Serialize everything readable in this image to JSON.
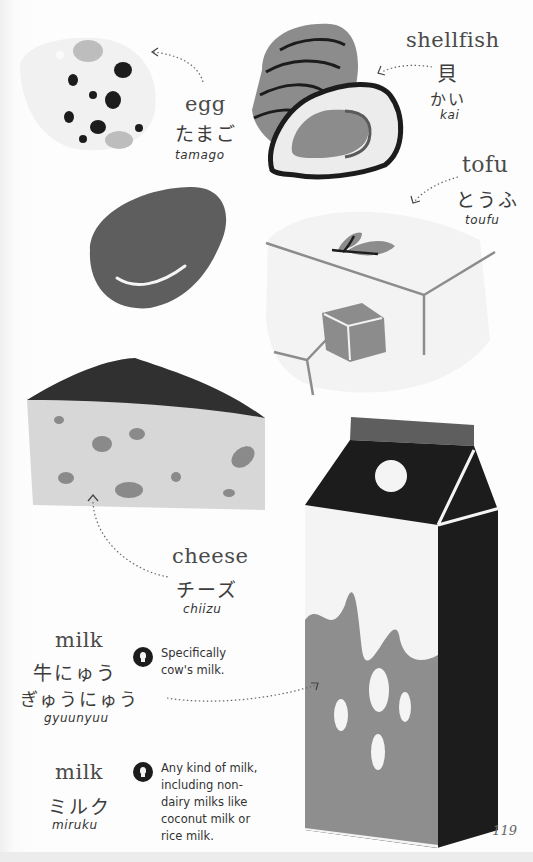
{
  "page": {
    "number": "119"
  },
  "colors": {
    "black": "#1c1c1c",
    "dark_gray": "#5f5f5f",
    "mid_gray": "#8e8e8e",
    "light_gray": "#d7d7d7",
    "very_light": "#efefef"
  },
  "entries": {
    "egg": {
      "english": "egg",
      "japanese": "たまご",
      "romaji": "tamago",
      "icon": "egg-illustration"
    },
    "shellfish": {
      "english": "shellfish",
      "japanese": "貝",
      "kana": "かい",
      "romaji": "kai",
      "icon": "shellfish-illustration"
    },
    "tofu": {
      "english": "tofu",
      "japanese": "とうふ",
      "romaji": "toufu",
      "icon": "tofu-illustration"
    },
    "cheese": {
      "english": "cheese",
      "japanese": "チーズ",
      "romaji": "chiizu",
      "icon": "cheese-illustration"
    },
    "milk_cow": {
      "english": "milk",
      "japanese": "牛にゅう",
      "kana": "ぎゅうにゅう",
      "romaji": "gyuunyuu",
      "note": "Specifically\ncow's milk.",
      "note_icon": "lightbulb-icon"
    },
    "milk_any": {
      "english": "milk",
      "japanese": "ミルク",
      "romaji": "miruku",
      "note": "Any kind of milk,\nincluding non-\ndairy milks like\ncoconut milk or\nrice milk.",
      "note_icon": "lightbulb-icon"
    }
  }
}
